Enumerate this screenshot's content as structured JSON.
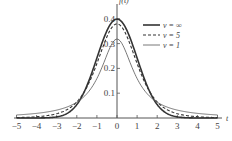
{
  "chart_data": {
    "type": "line",
    "title": "",
    "xlabel": "t",
    "ylabel": "f(t)",
    "xlim": [
      -5,
      5
    ],
    "ylim": [
      0,
      0.42
    ],
    "x_ticks": [
      "-5",
      "-4",
      "-3",
      "-2",
      "-1",
      "0",
      "1",
      "2",
      "3",
      "4",
      "5"
    ],
    "y_ticks": [
      "0.1",
      "0.2",
      "0.3",
      "0.4"
    ],
    "grid": false,
    "legend_position": "upper right",
    "x": [
      -5,
      -4,
      -3,
      -2,
      -1,
      0,
      1,
      2,
      3,
      4,
      5
    ],
    "series": [
      {
        "name": "ν = ∞",
        "style": "solid-thick",
        "values": [
          1.5e-06,
          0.00013,
          0.0044,
          0.054,
          0.242,
          0.399,
          0.242,
          0.054,
          0.0044,
          0.00013,
          1.5e-06
        ]
      },
      {
        "name": "ν = 5",
        "style": "dashed",
        "values": [
          0.0018,
          0.0051,
          0.0173,
          0.0651,
          0.2197,
          0.3796,
          0.2197,
          0.0651,
          0.0173,
          0.0051,
          0.0018
        ]
      },
      {
        "name": "ν = 1",
        "style": "solid-thin",
        "values": [
          0.0122,
          0.0187,
          0.0318,
          0.0637,
          0.1592,
          0.3183,
          0.1592,
          0.0637,
          0.0318,
          0.0187,
          0.0122
        ]
      }
    ]
  }
}
